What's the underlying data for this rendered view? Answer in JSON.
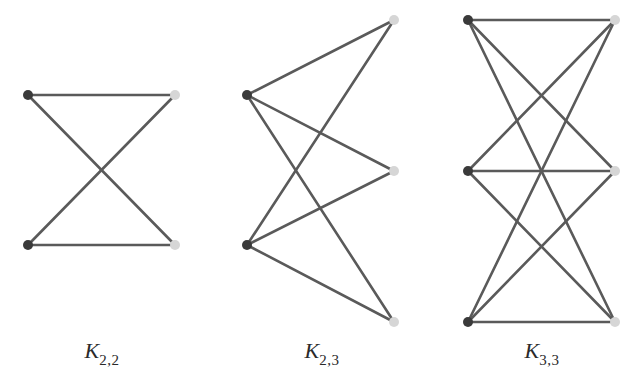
{
  "colors": {
    "edge": "#5a5a5a",
    "left_node": "#3a3a3a",
    "right_node": "#d6d6d6",
    "background": "#ffffff"
  },
  "graphs": [
    {
      "name": "K2,2",
      "label_main": "K",
      "label_sub": "2,2",
      "label_x": 102,
      "left_nodes": [
        [
          28,
          95
        ],
        [
          28,
          245
        ]
      ],
      "right_nodes": [
        [
          175,
          95
        ],
        [
          175,
          245
        ]
      ]
    },
    {
      "name": "K2,3",
      "label_main": "K",
      "label_sub": "2,3",
      "label_x": 322,
      "left_nodes": [
        [
          247,
          95
        ],
        [
          247,
          245
        ]
      ],
      "right_nodes": [
        [
          394,
          20
        ],
        [
          394,
          171
        ],
        [
          394,
          322
        ]
      ]
    },
    {
      "name": "K3,3",
      "label_main": "K",
      "label_sub": "3,3",
      "label_x": 542,
      "left_nodes": [
        [
          468,
          20
        ],
        [
          468,
          171
        ],
        [
          468,
          322
        ]
      ],
      "right_nodes": [
        [
          615,
          20
        ],
        [
          615,
          171
        ],
        [
          615,
          322
        ]
      ]
    }
  ],
  "node_radius": 5
}
